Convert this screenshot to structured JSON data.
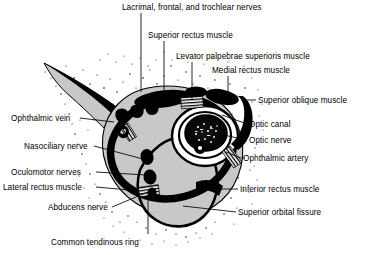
{
  "figure": {
    "kind": "anatomical-illustration",
    "colors": {
      "background": "#ffffff",
      "ink": "#000000",
      "bone_fill": "#c8c8c8",
      "soft_tissue_fill": "#cccccc",
      "stipple": "#111111"
    }
  },
  "labels": [
    {
      "id": "lacrimal-frontal-trochlear-nerves",
      "text": "Lacrimal, frontal, and trochlear nerves",
      "x": 122,
      "y": 3,
      "align": "left"
    },
    {
      "id": "superior-rectus-muscle",
      "text": "Superior rectus muscle",
      "x": 148,
      "y": 31,
      "align": "left"
    },
    {
      "id": "levator-palpebrae-superioris",
      "text": "Levator palpebrae superioris muscle",
      "x": 176,
      "y": 52,
      "align": "left"
    },
    {
      "id": "medial-rectus-muscle",
      "text": "Medial rectus muscle",
      "x": 212,
      "y": 66,
      "align": "left"
    },
    {
      "id": "superior-oblique-muscle",
      "text": "Superior oblique muscle",
      "x": 258,
      "y": 96,
      "align": "left"
    },
    {
      "id": "optic-canal",
      "text": "Optic canal",
      "x": 249,
      "y": 120,
      "align": "left"
    },
    {
      "id": "optic-nerve",
      "text": "Optic nerve",
      "x": 249,
      "y": 136,
      "align": "left"
    },
    {
      "id": "ophthalmic-artery",
      "text": "Ophthalmic artery",
      "x": 243,
      "y": 154,
      "align": "left"
    },
    {
      "id": "inferior-rectus-muscle",
      "text": "Inferior rectus muscle",
      "x": 240,
      "y": 185,
      "align": "left"
    },
    {
      "id": "superior-orbital-fissure",
      "text": "Superior orbital fissure",
      "x": 238,
      "y": 208,
      "align": "left"
    },
    {
      "id": "ophthalmic-vein",
      "text": "Ophthalmic vein",
      "x": 11,
      "y": 114,
      "align": "left"
    },
    {
      "id": "nasociliary-nerve",
      "text": "Nasociliary nerve",
      "x": 24,
      "y": 142,
      "align": "left"
    },
    {
      "id": "oculomotor-nerves",
      "text": "Oculomotor nerves",
      "x": 11,
      "y": 168,
      "align": "left"
    },
    {
      "id": "lateral-rectus-muscle",
      "text": "Lateral rectus muscle",
      "x": 3,
      "y": 183,
      "align": "left"
    },
    {
      "id": "abducens-nerve",
      "text": "Abducens nerve",
      "x": 48,
      "y": 203,
      "align": "left"
    },
    {
      "id": "common-tendinous-ring",
      "text": "Common tendinous ring",
      "x": 51,
      "y": 238,
      "align": "left"
    }
  ],
  "leaders": [
    {
      "id": "leader-lacrimal",
      "points": "141,13 141,92"
    },
    {
      "id": "leader-superior-rectus",
      "points": "164,41 164,96"
    },
    {
      "id": "leader-levator",
      "points": "192,62 192,100"
    },
    {
      "id": "leader-medial-rectus",
      "points": "228,76 228,105"
    },
    {
      "id": "leader-superior-oblique",
      "points": "256,100 241,100"
    },
    {
      "id": "leader-optic-canal",
      "points": "247,124 222,115"
    },
    {
      "id": "leader-optic-nerve",
      "points": "247,140 219,134"
    },
    {
      "id": "leader-ophthalmic-artery",
      "points": "241,158 226,152"
    },
    {
      "id": "leader-inferior-rectus",
      "points": "238,189 205,189"
    },
    {
      "id": "leader-superior-fissure",
      "points": "236,212 183,206"
    },
    {
      "id": "leader-ophthalmic-vein",
      "points": "80,118 114,122"
    },
    {
      "id": "leader-nasociliary",
      "points": "94,146 143,159"
    },
    {
      "id": "leader-oculomotor",
      "points": "96,172 146,175"
    },
    {
      "id": "leader-lateral-rectus",
      "points": "96,187 129,190"
    },
    {
      "id": "leader-abducens",
      "points": "112,207 148,192"
    },
    {
      "id": "leader-common-tendinous",
      "points": "148,234 148,196"
    }
  ]
}
